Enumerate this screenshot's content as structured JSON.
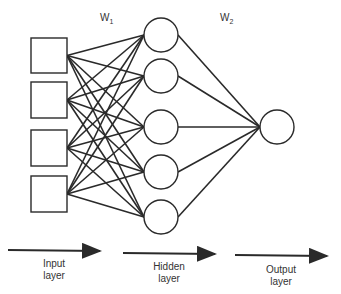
{
  "weights": {
    "w1": {
      "base": "W",
      "sub": "1"
    },
    "w2": {
      "base": "W",
      "sub": "2"
    }
  },
  "layers": {
    "input": {
      "line1": "Input",
      "line2": "layer",
      "node_count": 4,
      "node_shape": "square"
    },
    "hidden": {
      "line1": "Hidden",
      "line2": "layer",
      "node_count": 5,
      "node_shape": "circle"
    },
    "output": {
      "line1": "Output",
      "line2": "layer",
      "node_count": 1,
      "node_shape": "circle"
    }
  },
  "colors": {
    "stroke": "#2a2a2a",
    "text": "#333333",
    "background": "#ffffff"
  }
}
